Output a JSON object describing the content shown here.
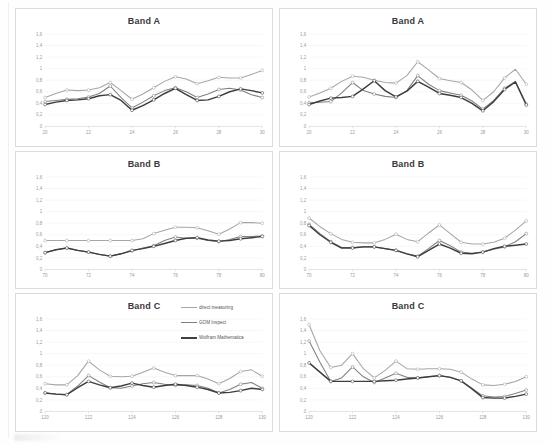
{
  "document": {
    "kind": "scanned-figure",
    "background_color": "#fefefe"
  },
  "legend": {
    "position": "top-right of bottom-left chart",
    "entries": [
      {
        "label": "direct measuring",
        "color": "#a6a6a6"
      },
      {
        "label": "GOM Inspect",
        "color": "#7f7f7f"
      },
      {
        "label": "Wolfram Mathematica",
        "color": "#404040"
      }
    ]
  },
  "series_colors": {
    "direct_measuring": "#a6a6a6",
    "gom_inspect": "#808080",
    "wolfram_mathematica": "#3d3d3d"
  },
  "chart_data": [
    {
      "id": "band-a-left",
      "type": "line",
      "title": "Band A",
      "xlabel": "",
      "ylabel": "",
      "ylim": [
        0,
        1.6
      ],
      "yticks": [
        "0",
        "0,2",
        "0,4",
        "0,6",
        "0,8",
        "1",
        "1,2",
        "1,4",
        "1,6"
      ],
      "ytick_values": [
        0,
        0.2,
        0.4,
        0.6,
        0.8,
        1.0,
        1.2,
        1.4,
        1.6
      ],
      "xlim": [
        20,
        30
      ],
      "xticks": [
        "20",
        "22",
        "24",
        "26",
        "28",
        "30"
      ],
      "xtick_values": [
        20,
        22,
        24,
        26,
        28,
        30
      ],
      "grid": true,
      "legend": false,
      "x": [
        20,
        20.5,
        21,
        21.5,
        22,
        22.5,
        23,
        23.5,
        24,
        24.5,
        25,
        25.5,
        26,
        26.5,
        27,
        27.5,
        28,
        28.5,
        29,
        29.5,
        30
      ],
      "series": [
        {
          "name": "direct measuring",
          "color": "#a6a6a6",
          "values": [
            0.5,
            0.57,
            0.63,
            0.62,
            0.63,
            0.67,
            0.76,
            0.62,
            0.47,
            0.56,
            0.67,
            0.78,
            0.86,
            0.82,
            0.74,
            0.79,
            0.85,
            0.84,
            0.84,
            0.9,
            0.97
          ]
        },
        {
          "name": "GOM Inspect",
          "color": "#808080",
          "values": [
            0.43,
            0.45,
            0.47,
            0.48,
            0.51,
            0.57,
            0.7,
            0.5,
            0.32,
            0.42,
            0.53,
            0.62,
            0.67,
            0.6,
            0.5,
            0.56,
            0.64,
            0.66,
            0.63,
            0.55,
            0.5
          ]
        },
        {
          "name": "Wolfram Mathematica",
          "color": "#3d3d3d",
          "values": [
            0.38,
            0.42,
            0.45,
            0.46,
            0.48,
            0.53,
            0.55,
            0.45,
            0.28,
            0.36,
            0.46,
            0.57,
            0.66,
            0.55,
            0.45,
            0.46,
            0.52,
            0.6,
            0.65,
            0.62,
            0.58
          ]
        }
      ]
    },
    {
      "id": "band-a-right",
      "type": "line",
      "title": "Band A",
      "xlabel": "",
      "ylabel": "",
      "ylim": [
        0,
        1.6
      ],
      "yticks": [
        "0",
        "0,2",
        "0,4",
        "0,6",
        "0,8",
        "1",
        "1,2",
        "1,4",
        "1,6"
      ],
      "ytick_values": [
        0,
        0.2,
        0.4,
        0.6,
        0.8,
        1.0,
        1.2,
        1.4,
        1.6
      ],
      "xlim": [
        20,
        30
      ],
      "xticks": [
        "20",
        "22",
        "24",
        "26",
        "28",
        "30"
      ],
      "xtick_values": [
        20,
        22,
        24,
        26,
        28,
        30
      ],
      "grid": true,
      "legend": false,
      "x": [
        20,
        20.5,
        21,
        21.5,
        22,
        22.5,
        23,
        23.5,
        24,
        24.5,
        25,
        25.5,
        26,
        26.5,
        27,
        27.5,
        28,
        28.5,
        29,
        29.5,
        30
      ],
      "series": [
        {
          "name": "direct measuring",
          "color": "#a6a6a6",
          "values": [
            0.51,
            0.58,
            0.66,
            0.78,
            0.87,
            0.85,
            0.8,
            0.76,
            0.75,
            0.88,
            1.12,
            0.98,
            0.83,
            0.79,
            0.76,
            0.63,
            0.45,
            0.6,
            0.84,
            0.99,
            0.73
          ]
        },
        {
          "name": "GOM Inspect",
          "color": "#808080",
          "values": [
            0.41,
            0.42,
            0.43,
            0.58,
            0.76,
            0.62,
            0.56,
            0.52,
            0.5,
            0.62,
            0.88,
            0.73,
            0.62,
            0.58,
            0.54,
            0.44,
            0.3,
            0.45,
            0.66,
            0.78,
            0.39
          ]
        },
        {
          "name": "Wolfram Mathematica",
          "color": "#3d3d3d",
          "values": [
            0.38,
            0.44,
            0.49,
            0.5,
            0.52,
            0.65,
            0.79,
            0.62,
            0.51,
            0.61,
            0.78,
            0.68,
            0.57,
            0.54,
            0.5,
            0.4,
            0.27,
            0.43,
            0.64,
            0.77,
            0.37
          ]
        }
      ]
    },
    {
      "id": "band-b-left",
      "type": "line",
      "title": "Band B",
      "xlabel": "",
      "ylabel": "",
      "ylim": [
        0,
        1.6
      ],
      "yticks": [
        "0",
        "0,2",
        "0,4",
        "0,6",
        "0,8",
        "1",
        "1,2",
        "1,4",
        "1,6"
      ],
      "ytick_values": [
        0,
        0.2,
        0.4,
        0.6,
        0.8,
        1.0,
        1.2,
        1.4,
        1.6
      ],
      "xlim": [
        70,
        80
      ],
      "xticks": [
        "70",
        "72",
        "74",
        "76",
        "78",
        "80"
      ],
      "xtick_values": [
        70,
        72,
        74,
        76,
        78,
        80
      ],
      "grid": true,
      "legend": false,
      "x": [
        70,
        70.5,
        71,
        71.5,
        72,
        72.5,
        73,
        73.5,
        74,
        74.5,
        75,
        75.5,
        76,
        76.5,
        77,
        77.5,
        78,
        78.5,
        79,
        79.5,
        80
      ],
      "series": [
        {
          "name": "direct measuring",
          "color": "#a6a6a6",
          "values": [
            0.5,
            0.5,
            0.5,
            0.5,
            0.5,
            0.5,
            0.5,
            0.5,
            0.5,
            0.53,
            0.62,
            0.68,
            0.73,
            0.73,
            0.72,
            0.67,
            0.61,
            0.7,
            0.81,
            0.81,
            0.8
          ]
        },
        {
          "name": "GOM Inspect",
          "color": "#808080",
          "values": [
            0.29,
            0.34,
            0.37,
            0.33,
            0.3,
            0.26,
            0.23,
            0.27,
            0.32,
            0.37,
            0.41,
            0.5,
            0.56,
            0.54,
            0.54,
            0.5,
            0.48,
            0.52,
            0.57,
            0.57,
            0.58
          ]
        },
        {
          "name": "Wolfram Mathematica",
          "color": "#3d3d3d",
          "values": [
            0.29,
            0.34,
            0.37,
            0.33,
            0.3,
            0.26,
            0.23,
            0.27,
            0.33,
            0.36,
            0.4,
            0.45,
            0.5,
            0.54,
            0.55,
            0.51,
            0.49,
            0.5,
            0.53,
            0.55,
            0.57
          ]
        }
      ]
    },
    {
      "id": "band-b-right",
      "type": "line",
      "title": "Band B",
      "xlabel": "",
      "ylabel": "",
      "ylim": [
        0,
        1.6
      ],
      "yticks": [
        "0",
        "0,2",
        "0,4",
        "0,6",
        "0,8",
        "1",
        "1,2",
        "1,4",
        "1,6"
      ],
      "ytick_values": [
        0,
        0.2,
        0.4,
        0.6,
        0.8,
        1.0,
        1.2,
        1.4,
        1.6
      ],
      "xlim": [
        70,
        80
      ],
      "xticks": [
        "70",
        "72",
        "74",
        "76",
        "78",
        "80"
      ],
      "xtick_values": [
        70,
        72,
        74,
        76,
        78,
        80
      ],
      "grid": true,
      "legend": false,
      "x": [
        70,
        70.5,
        71,
        71.5,
        72,
        72.5,
        73,
        73.5,
        74,
        74.5,
        75,
        75.5,
        76,
        76.5,
        77,
        77.5,
        78,
        78.5,
        79,
        79.5,
        80
      ],
      "series": [
        {
          "name": "direct measuring",
          "color": "#a6a6a6",
          "values": [
            0.89,
            0.74,
            0.62,
            0.52,
            0.47,
            0.46,
            0.46,
            0.52,
            0.61,
            0.52,
            0.48,
            0.63,
            0.77,
            0.62,
            0.47,
            0.44,
            0.44,
            0.47,
            0.54,
            0.68,
            0.84
          ]
        },
        {
          "name": "GOM Inspect",
          "color": "#808080",
          "values": [
            0.78,
            0.62,
            0.48,
            0.38,
            0.38,
            0.39,
            0.39,
            0.36,
            0.33,
            0.27,
            0.23,
            0.36,
            0.5,
            0.41,
            0.3,
            0.28,
            0.3,
            0.35,
            0.39,
            0.48,
            0.62
          ]
        },
        {
          "name": "Wolfram Mathematica",
          "color": "#3d3d3d",
          "values": [
            0.76,
            0.6,
            0.47,
            0.37,
            0.37,
            0.39,
            0.39,
            0.36,
            0.33,
            0.27,
            0.22,
            0.33,
            0.44,
            0.37,
            0.28,
            0.27,
            0.3,
            0.36,
            0.4,
            0.42,
            0.44
          ]
        }
      ]
    },
    {
      "id": "band-c-left",
      "type": "line",
      "title": "Band C",
      "xlabel": "",
      "ylabel": "",
      "ylim": [
        0,
        1.6
      ],
      "yticks": [
        "0",
        "0,2",
        "0,4",
        "0,6",
        "0,8",
        "1",
        "1,2",
        "1,4",
        "1,6"
      ],
      "ytick_values": [
        0,
        0.2,
        0.4,
        0.6,
        0.8,
        1.0,
        1.2,
        1.4,
        1.6
      ],
      "xlim": [
        120,
        130
      ],
      "xticks": [
        "120",
        "122",
        "124",
        "126",
        "128",
        "130"
      ],
      "xtick_values": [
        120,
        122,
        124,
        126,
        128,
        130
      ],
      "grid": true,
      "legend": true,
      "x": [
        120,
        120.5,
        121,
        121.5,
        122,
        122.5,
        123,
        123.5,
        124,
        124.5,
        125,
        125.5,
        126,
        126.5,
        127,
        127.5,
        128,
        128.5,
        129,
        129.5,
        130
      ],
      "series": [
        {
          "name": "direct measuring",
          "color": "#a6a6a6",
          "values": [
            0.48,
            0.46,
            0.46,
            0.62,
            0.87,
            0.72,
            0.61,
            0.6,
            0.61,
            0.68,
            0.75,
            0.68,
            0.62,
            0.62,
            0.62,
            0.56,
            0.48,
            0.57,
            0.69,
            0.72,
            0.61
          ]
        },
        {
          "name": "GOM Inspect",
          "color": "#808080",
          "values": [
            0.32,
            0.3,
            0.29,
            0.44,
            0.62,
            0.51,
            0.41,
            0.4,
            0.44,
            0.48,
            0.5,
            0.47,
            0.45,
            0.46,
            0.45,
            0.4,
            0.32,
            0.38,
            0.47,
            0.5,
            0.4
          ]
        },
        {
          "name": "Wolfram Mathematica",
          "color": "#3d3d3d",
          "values": [
            0.32,
            0.3,
            0.29,
            0.41,
            0.52,
            0.46,
            0.41,
            0.44,
            0.49,
            0.45,
            0.42,
            0.45,
            0.47,
            0.45,
            0.42,
            0.38,
            0.32,
            0.33,
            0.36,
            0.4,
            0.38
          ]
        }
      ]
    },
    {
      "id": "band-c-right",
      "type": "line",
      "title": "Band C",
      "xlabel": "",
      "ylabel": "",
      "ylim": [
        0,
        1.6
      ],
      "yticks": [
        "0",
        "0,2",
        "0,4",
        "0,6",
        "0,8",
        "1",
        "1,2",
        "1,4",
        "1,6"
      ],
      "ytick_values": [
        0,
        0.2,
        0.4,
        0.6,
        0.8,
        1.0,
        1.2,
        1.4,
        1.6
      ],
      "xlim": [
        120,
        130
      ],
      "xticks": [
        "120",
        "122",
        "124",
        "126",
        "128",
        "130"
      ],
      "xtick_values": [
        120,
        122,
        124,
        126,
        128,
        130
      ],
      "grid": true,
      "legend": false,
      "x": [
        120,
        120.5,
        121,
        121.5,
        122,
        122.5,
        123,
        123.5,
        124,
        124.5,
        125,
        125.5,
        126,
        126.5,
        127,
        127.5,
        128,
        128.5,
        129,
        129.5,
        130
      ],
      "series": [
        {
          "name": "direct measuring",
          "color": "#a6a6a6",
          "values": [
            1.5,
            1.05,
            0.76,
            0.8,
            1.0,
            0.74,
            0.58,
            0.71,
            0.87,
            0.74,
            0.73,
            0.74,
            0.74,
            0.73,
            0.68,
            0.56,
            0.46,
            0.45,
            0.47,
            0.52,
            0.6
          ]
        },
        {
          "name": "GOM Inspect",
          "color": "#808080",
          "values": [
            1.22,
            0.85,
            0.52,
            0.58,
            0.77,
            0.6,
            0.5,
            0.58,
            0.66,
            0.59,
            0.58,
            0.6,
            0.62,
            0.59,
            0.53,
            0.4,
            0.27,
            0.25,
            0.26,
            0.31,
            0.37
          ]
        },
        {
          "name": "Wolfram Mathematica",
          "color": "#3d3d3d",
          "values": [
            0.84,
            0.68,
            0.52,
            0.52,
            0.52,
            0.52,
            0.52,
            0.53,
            0.54,
            0.56,
            0.58,
            0.6,
            0.62,
            0.59,
            0.53,
            0.39,
            0.24,
            0.23,
            0.23,
            0.26,
            0.3
          ]
        }
      ]
    }
  ]
}
